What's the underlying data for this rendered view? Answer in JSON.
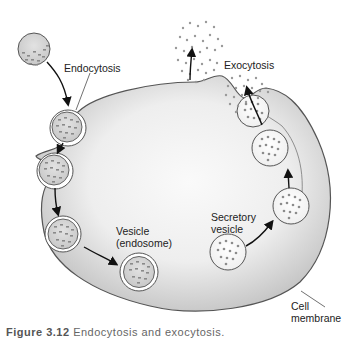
{
  "figure": {
    "labels": {
      "endocytosis": "Endocytosis",
      "exocytosis": "Exocytosis",
      "vesicle_line1": "Vesicle",
      "vesicle_line2": "(endosome)",
      "secretory_line1": "Secretory",
      "secretory_line2": "vesicle",
      "membrane_line1": "Cell",
      "membrane_line2": "membrane"
    },
    "caption": {
      "number": "Figure 3.12",
      "text": "Endocytosis and exocytosis."
    },
    "colors": {
      "cell_edge": "#c4c4c4",
      "cell_center": "#f4f4f4",
      "outline": "#555555",
      "vesicle_fill": "#d0d0d0",
      "particle": "#8a8a8a",
      "arrow": "#111111"
    }
  }
}
